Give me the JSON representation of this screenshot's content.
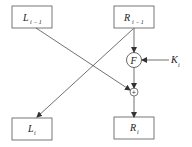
{
  "diagram": {
    "type": "feistel-round",
    "boxes": {
      "l_prev": {
        "main": "L",
        "sub": "i − 1"
      },
      "r_prev": {
        "main": "R",
        "sub": "i − 1"
      },
      "l_next": {
        "main": "L",
        "sub": "i"
      },
      "r_next": {
        "main": "R",
        "sub": "i"
      }
    },
    "function": {
      "label": "F"
    },
    "xor": {
      "symbol": "+"
    },
    "key": {
      "main": "K",
      "sub": "i"
    },
    "colors": {
      "stroke": "#333333",
      "background": "#ffffff"
    }
  }
}
